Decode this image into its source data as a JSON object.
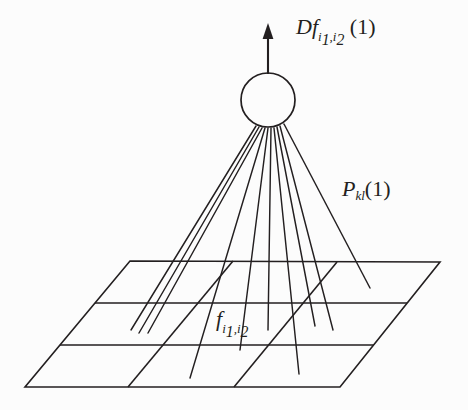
{
  "figure": {
    "background_color": "#fcfcfc",
    "stroke_color": "#231f20",
    "width": 468,
    "height": 410,
    "labels": {
      "derivative": {
        "base": "Df",
        "sub_a": "i",
        "sub_a_index": "1",
        "sub_sep": ",",
        "sub_b": "i",
        "sub_b_index": "2",
        "argument": "(1)",
        "full_text": "Df_{i1,i2}(1)"
      },
      "projection": {
        "base": "P",
        "sub": "kl",
        "argument": "(1)",
        "full_text": "P_{kl}(1)"
      },
      "function": {
        "base": "f",
        "sub_a": "i",
        "sub_a_index": "1",
        "sub_sep": ",",
        "sub_b": "i",
        "sub_b_index": "2",
        "full_text": "f_{i1,i2}"
      }
    },
    "geometry": {
      "source_circle": {
        "cx": 268,
        "cy": 100,
        "r": 27
      },
      "arrow": {
        "x": 268,
        "y_tail": 74,
        "y_tip": 25
      },
      "grid_plane": {
        "top_left": [
          130,
          261
        ],
        "top_right": [
          440,
          262
        ],
        "bottom_right": [
          340,
          387
        ],
        "bottom_left": [
          25,
          387
        ],
        "rows": 3,
        "columns": 3
      },
      "ray_count": 10
    }
  }
}
